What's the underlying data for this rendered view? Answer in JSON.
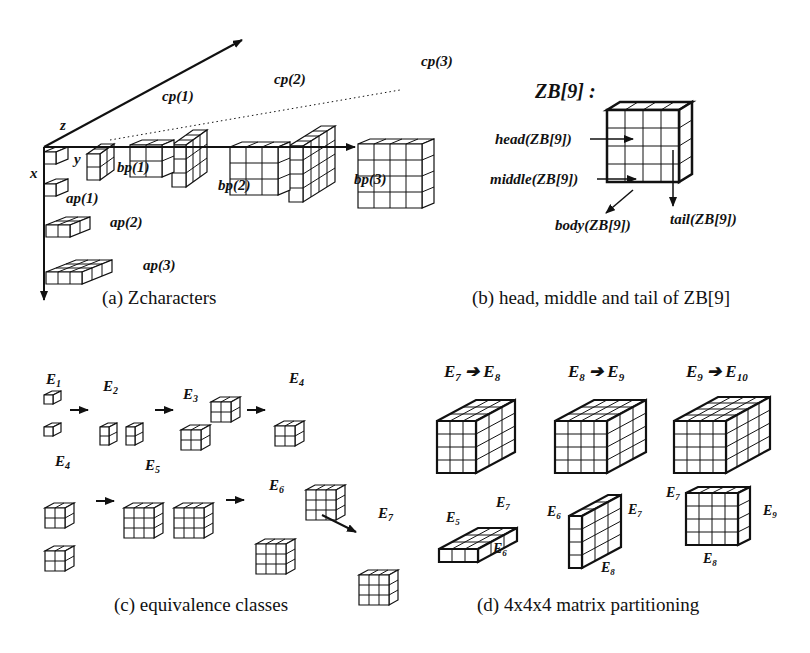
{
  "panels": {
    "a": {
      "caption": "(a) Zcharacters",
      "axis_labels": {
        "x": "x",
        "y": "y",
        "z": "z"
      },
      "labels": {
        "ap1": "ap(1)",
        "ap2": "ap(2)",
        "ap3": "ap(3)",
        "bp1": "bp(1)",
        "bp2": "bp(2)",
        "bp3": "bp(3)",
        "cp1": "cp(1)",
        "cp2": "cp(2)",
        "cp3": "cp(3)"
      }
    },
    "b": {
      "caption": "(b) head, middle and tail of ZB[9]",
      "title": "ZB[9] :",
      "labels": {
        "head": "head(ZB[9])",
        "middle": "middle(ZB[9])",
        "body": "body(ZB[9])",
        "tail": "tail(ZB[9])"
      }
    },
    "c": {
      "caption": "(c) equivalence classes",
      "labels": {
        "E1": "E",
        "E1s": "1",
        "E2": "E",
        "E2s": "2",
        "E3": "E",
        "E3s": "3",
        "E4a": "E",
        "E4as": "4",
        "E4b": "E",
        "E4bs": "4",
        "E5": "E",
        "E5s": "5",
        "E6": "E",
        "E6s": "6",
        "E7": "E",
        "E7s": "7"
      }
    },
    "d": {
      "caption": "(d) 4x4x4 matrix partitioning",
      "transitions": [
        {
          "from": "E",
          "from_sub": "7",
          "to": "E",
          "to_sub": "8"
        },
        {
          "from": "E",
          "from_sub": "8",
          "to": "E",
          "to_sub": "9"
        },
        {
          "from": "E",
          "from_sub": "9",
          "to": "E",
          "to_sub": "10"
        }
      ],
      "part_labels": {
        "p1": [
          {
            "t": "E",
            "s": "5"
          },
          {
            "t": "E",
            "s": "7"
          },
          {
            "t": "E",
            "s": "6"
          }
        ],
        "p2": [
          {
            "t": "E",
            "s": "6"
          },
          {
            "t": "E",
            "s": "7"
          },
          {
            "t": "E",
            "s": "8"
          }
        ],
        "p3": [
          {
            "t": "E",
            "s": "7"
          },
          {
            "t": "E",
            "s": "9"
          },
          {
            "t": "E",
            "s": "8"
          }
        ]
      }
    }
  }
}
